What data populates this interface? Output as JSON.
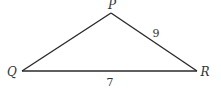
{
  "diagram": {
    "type": "triangle",
    "stroke_color": "#2a2a2a",
    "vertices": [
      {
        "id": "P",
        "label": "P",
        "x": 111,
        "y": 13,
        "label_x": 112,
        "label_y": 9
      },
      {
        "id": "Q",
        "label": "Q",
        "x": 22,
        "y": 71,
        "label_x": 12,
        "label_y": 76
      },
      {
        "id": "R",
        "label": "R",
        "x": 197,
        "y": 71,
        "label_x": 205,
        "label_y": 76
      }
    ],
    "sides": [
      {
        "from": "P",
        "to": "R",
        "length_label": "9",
        "label_x": 156,
        "label_y": 37
      },
      {
        "from": "Q",
        "to": "R",
        "length_label": "7",
        "label_x": 110,
        "label_y": 85
      },
      {
        "from": "Q",
        "to": "P",
        "length_label": ""
      }
    ]
  }
}
